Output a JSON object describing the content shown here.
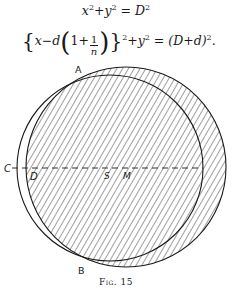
{
  "equations": {
    "eq1": {
      "lhs_x": "x",
      "sup_x": "2",
      "plus": "+",
      "lhs_y": "y",
      "sup_y": "2",
      "eq": " = ",
      "rhs": "D",
      "sup_rhs": "2"
    },
    "eq2": {
      "open_brace": "{",
      "x": "x",
      "minus_d": "−d",
      "open_paren": "(",
      "one_plus": "1+",
      "frac_num": "1",
      "frac_den": "n",
      "close_paren": ")",
      "close_brace": "}",
      "sup_outer": "2",
      "plus_y": "+y",
      "sup_y": "2",
      "eq": " = (D+d)",
      "sup_rhs": "2",
      "period": "."
    }
  },
  "figure": {
    "labels": {
      "A": "A",
      "B": "B",
      "C": "C",
      "D": "D",
      "S": "S",
      "M": "M"
    },
    "caption": "Fig. 15",
    "circle_left": {
      "cx": 110,
      "cy": 168,
      "r": 93
    },
    "circle_right": {
      "cx": 126,
      "cy": 167,
      "r": 100
    },
    "stroke_color": "#1a1a1a",
    "hatch_color": "#2a2a2a"
  }
}
